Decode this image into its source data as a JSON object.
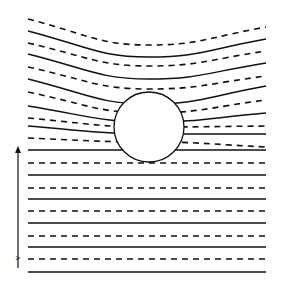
{
  "diagram": {
    "colors": {
      "line": "#111111",
      "background": "#ffffff"
    },
    "circle": {
      "cx": 149,
      "cy": 127,
      "r": 35
    },
    "arrow": {
      "x": 18,
      "y_start": 268,
      "y_end": 146,
      "label": "v"
    },
    "streamlines": [
      {
        "style": "dashed",
        "left": 19,
        "mid": 45,
        "right": 27
      },
      {
        "style": "solid",
        "left": 31,
        "mid": 57,
        "right": 39
      },
      {
        "style": "dashed",
        "left": 43,
        "mid": 66,
        "right": 51
      },
      {
        "style": "solid",
        "left": 54,
        "mid": 79,
        "right": 63
      },
      {
        "style": "dashed",
        "left": 67,
        "mid": 89,
        "right": 76
      },
      {
        "style": "solid",
        "left": 79,
        "mid": 104,
        "right": 86
      },
      {
        "style": "dashed",
        "left": 92,
        "mid": 113,
        "right": 100
      },
      {
        "style": "solid",
        "left": 106,
        "mid": 122,
        "right": 113
      },
      {
        "style": "dashed",
        "left": 118,
        "mid": 127,
        "right": 126
      },
      {
        "style": "solid",
        "left": 126,
        "mid": 134,
        "right": 134
      },
      {
        "style": "dashed",
        "left": 138,
        "mid": 142,
        "right": 147
      },
      {
        "style": "solid",
        "left": 150,
        "mid": 150,
        "right": 150
      },
      {
        "style": "dashed",
        "left": 163,
        "mid": 163,
        "right": 163
      },
      {
        "style": "solid",
        "left": 175,
        "mid": 175,
        "right": 175
      },
      {
        "style": "dashed",
        "left": 188,
        "mid": 188,
        "right": 188
      },
      {
        "style": "solid",
        "left": 199,
        "mid": 199,
        "right": 199
      },
      {
        "style": "dashed",
        "left": 211,
        "mid": 211,
        "right": 211
      },
      {
        "style": "solid",
        "left": 223,
        "mid": 223,
        "right": 223
      },
      {
        "style": "dashed",
        "left": 236,
        "mid": 236,
        "right": 236
      },
      {
        "style": "solid",
        "left": 247,
        "mid": 247,
        "right": 247
      },
      {
        "style": "dashed",
        "left": 259,
        "mid": 259,
        "right": 259
      },
      {
        "style": "solid",
        "left": 272,
        "mid": 272,
        "right": 272
      }
    ]
  }
}
